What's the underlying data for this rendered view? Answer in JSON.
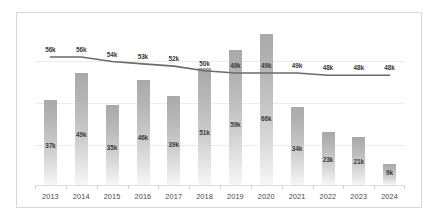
{
  "chart_data": {
    "type": "bar",
    "title": "",
    "subtitle": "",
    "xlabel": "",
    "ylabel": "",
    "grid": true,
    "legend_position": "none",
    "categories": [
      "2013",
      "2014",
      "2015",
      "2016",
      "2017",
      "2018",
      "2019",
      "2020",
      "2021",
      "2022",
      "2023",
      "2024"
    ],
    "ylim": [
      0,
      70
    ],
    "series": [
      {
        "name": "bars",
        "type": "bar",
        "color": "#b4b4b4",
        "values": [
          37,
          49,
          35,
          46,
          39,
          51,
          59,
          66,
          34,
          23,
          21,
          9
        ],
        "labels": [
          "37k",
          "49k",
          "35k",
          "46k",
          "39k",
          "51k",
          "59k",
          "66k",
          "34k",
          "23k",
          "21k",
          "9k"
        ]
      },
      {
        "name": "line",
        "type": "line",
        "color": "#6b6b6b",
        "values": [
          56,
          56,
          54,
          53,
          52,
          50,
          49,
          49,
          49,
          48,
          48,
          48
        ],
        "labels": [
          "56k",
          "56k",
          "54k",
          "53k",
          "52k",
          "50k",
          "49k",
          "49k",
          "49k",
          "48k",
          "48k",
          "48k"
        ]
      }
    ]
  },
  "style": {
    "frame_border_color": "#d8d8d8",
    "gridline_color": "#ececec",
    "background": "#ffffff",
    "bar_top_color": "#a9a9a9",
    "bar_bottom_color": "#f7f7f7",
    "line_color": "#6b6b6b",
    "text_color": "#3a3a3a",
    "axis_label_color": "#4a4a4a"
  }
}
